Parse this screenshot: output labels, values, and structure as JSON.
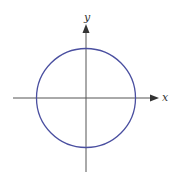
{
  "diagram": {
    "type": "coordinate-plane-circle",
    "axes": {
      "x_label": "x",
      "y_label": "y",
      "color": "#555555",
      "origin": {
        "x": 86,
        "y": 98
      },
      "x_axis": {
        "from": 13,
        "to": 158
      },
      "y_axis": {
        "from": 172,
        "to": 24
      }
    },
    "circle": {
      "cx": 86,
      "cy": 98,
      "r": 49.5,
      "stroke": "#4a4fa0"
    }
  }
}
